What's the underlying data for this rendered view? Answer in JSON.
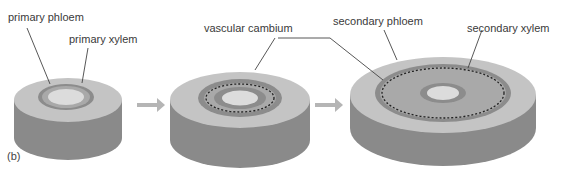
{
  "panel_label": "(b)",
  "labels": {
    "primary_phloem": "primary phloem",
    "primary_xylem": "primary xylem",
    "vascular_cambium": "vascular cambium",
    "secondary_phloem": "secondary phloem",
    "secondary_xylem": "secondary xylem"
  },
  "colors": {
    "cortex_top": "#c4c4c4",
    "cortex_side": "#8a8a8a",
    "phloem": "#8c8c8c",
    "xylem": "#a9a9a9",
    "pith": "#dcdcdc",
    "arrow": "#b5b5b5",
    "leader": "#444444"
  },
  "stages": [
    {
      "name": "primary growth"
    },
    {
      "name": "vascular cambium forming"
    },
    {
      "name": "secondary growth"
    }
  ]
}
